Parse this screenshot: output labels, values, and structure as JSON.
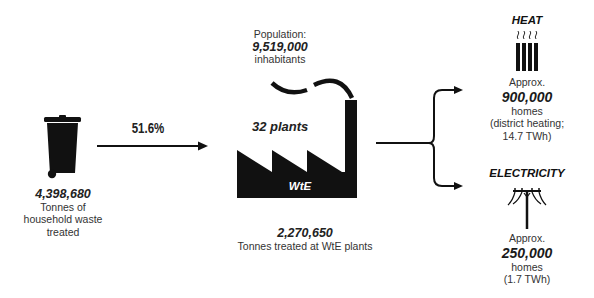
{
  "waste": {
    "icon": "wheelie-bin-icon",
    "value": "4,398,680",
    "label_line1": "Tonnes of",
    "label_line2": "household waste",
    "label_line3": "treated"
  },
  "flow": {
    "percentage": "51.6%",
    "icon": "arrow-right-icon"
  },
  "population": {
    "label": "Population:",
    "value": "9,519,000",
    "unit": "inhabitants"
  },
  "plants": {
    "icon": "factory-icon",
    "count_label": "32 plants",
    "factory_label": "WtE",
    "treated_value": "2,270,650",
    "treated_label": "Tonnes treated at WtE plants"
  },
  "heat": {
    "title": "HEAT",
    "icon": "radiator-icon",
    "approx": "Approx.",
    "value": "900,000",
    "unit": "homes",
    "detail_line1": "(district heating;",
    "detail_line2": "14.7 TWh)"
  },
  "electricity": {
    "title": "ELECTRICITY",
    "icon": "power-pole-icon",
    "approx": "Approx.",
    "value": "250,000",
    "unit": "homes",
    "detail_line1": "(1.7 TWh)"
  },
  "colors": {
    "ink": "#111111",
    "text": "#333333",
    "background": "#ffffff"
  }
}
